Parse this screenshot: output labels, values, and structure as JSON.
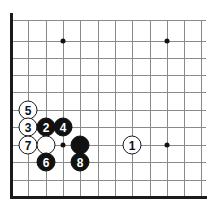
{
  "diagram": {
    "board": {
      "background_color": "#ffffff",
      "line_color": "#8a8a8a",
      "edge_color": "#1a1a1a",
      "columns_x": [
        11,
        28,
        46,
        63,
        80,
        98,
        115,
        132,
        150,
        167,
        184,
        201
      ],
      "rows_y": [
        20,
        41,
        58,
        75,
        92,
        110,
        127,
        145,
        162,
        180,
        197
      ],
      "grid_spacing": 17.3,
      "edges": [
        "left",
        "bottom"
      ]
    },
    "star_points": [
      {
        "name": "star-point-top-left",
        "x": 63,
        "y": 41
      },
      {
        "name": "star-point-top-right",
        "x": 167,
        "y": 41
      },
      {
        "name": "star-point-bottom-left",
        "x": 63,
        "y": 145
      },
      {
        "name": "star-point-bottom-right",
        "x": 167,
        "y": 145
      }
    ],
    "stones": [
      {
        "name": "stone-white-5",
        "color": "white",
        "label": "5",
        "x": 28,
        "y": 110
      },
      {
        "name": "stone-white-3",
        "color": "white",
        "label": "3",
        "x": 28,
        "y": 127
      },
      {
        "name": "stone-black-2",
        "color": "black",
        "label": "2",
        "x": 46,
        "y": 127
      },
      {
        "name": "stone-black-4",
        "color": "black",
        "label": "4",
        "x": 63,
        "y": 127
      },
      {
        "name": "stone-white-7",
        "color": "white",
        "label": "7",
        "x": 28,
        "y": 145
      },
      {
        "name": "stone-white-unnumbered",
        "color": "white",
        "label": "",
        "x": 46,
        "y": 145
      },
      {
        "name": "stone-black-unnumbered",
        "color": "black",
        "label": "",
        "x": 80,
        "y": 145
      },
      {
        "name": "stone-white-1",
        "color": "white",
        "label": "1",
        "x": 132,
        "y": 145
      },
      {
        "name": "stone-black-6",
        "color": "black",
        "label": "6",
        "x": 46,
        "y": 162
      },
      {
        "name": "stone-black-8",
        "color": "black",
        "label": "8",
        "x": 80,
        "y": 162
      }
    ]
  }
}
